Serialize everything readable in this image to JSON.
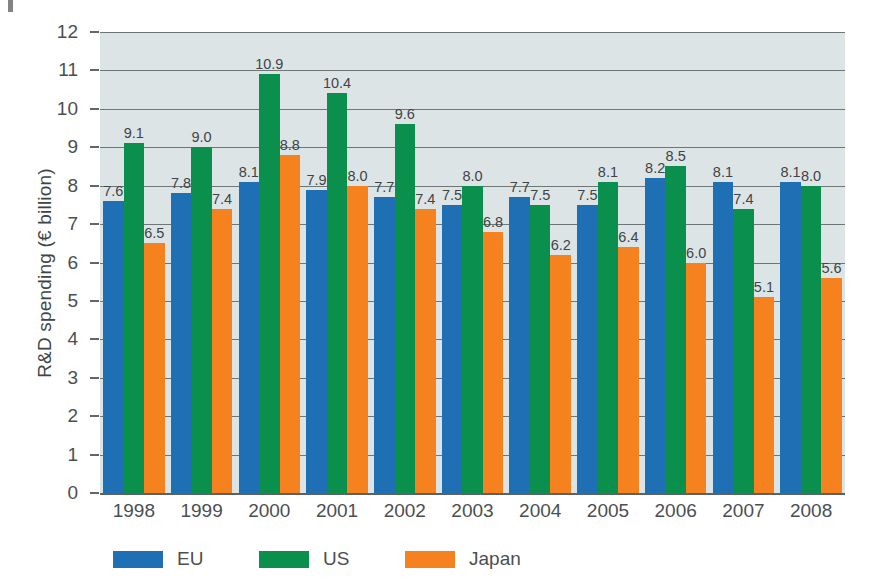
{
  "chart_data": {
    "type": "bar",
    "title": "",
    "xlabel": "",
    "ylabel": "R&D spending (€ billion)",
    "ylim": [
      0,
      12
    ],
    "ytick_step": 1,
    "grid": true,
    "legend_position": "bottom-left",
    "categories": [
      "1998",
      "1999",
      "2000",
      "2001",
      "2002",
      "2003",
      "2004",
      "2005",
      "2006",
      "2007",
      "2008"
    ],
    "yticks": [
      "0",
      "1",
      "2",
      "3",
      "4",
      "5",
      "6",
      "7",
      "8",
      "9",
      "10",
      "11",
      "12"
    ],
    "series": [
      {
        "name": "EU",
        "color": "#1f6fb5",
        "values": [
          7.6,
          7.8,
          8.1,
          7.9,
          7.7,
          7.5,
          7.7,
          7.5,
          8.2,
          8.1,
          8.1
        ],
        "labels": [
          "7.6",
          "7.8",
          "8.1",
          "7.9",
          "7.7",
          "7.5",
          "7.7",
          "7.5",
          "8.2",
          "8.1",
          "8.1"
        ]
      },
      {
        "name": "US",
        "color": "#0a8f4d",
        "values": [
          9.1,
          9.0,
          10.9,
          10.4,
          9.6,
          8.0,
          7.5,
          8.1,
          8.5,
          7.4,
          8.0
        ],
        "labels": [
          "9.1",
          "9.0",
          "10.9",
          "10.4",
          "9.6",
          "8.0",
          "7.5",
          "8.1",
          "8.5",
          "7.4",
          "8.0"
        ]
      },
      {
        "name": "Japan",
        "color": "#f5811f",
        "values": [
          6.5,
          7.4,
          8.8,
          8.0,
          7.4,
          6.8,
          6.2,
          6.4,
          6.0,
          5.1,
          5.6
        ],
        "labels": [
          "6.5",
          "7.4",
          "8.8",
          "8.0",
          "7.4",
          "6.8",
          "6.2",
          "6.4",
          "6.0",
          "5.1",
          "5.6"
        ]
      }
    ],
    "plot_background": "#dde4e6",
    "gridline_color": "#6e7678",
    "text_color": "#4a4f51"
  }
}
